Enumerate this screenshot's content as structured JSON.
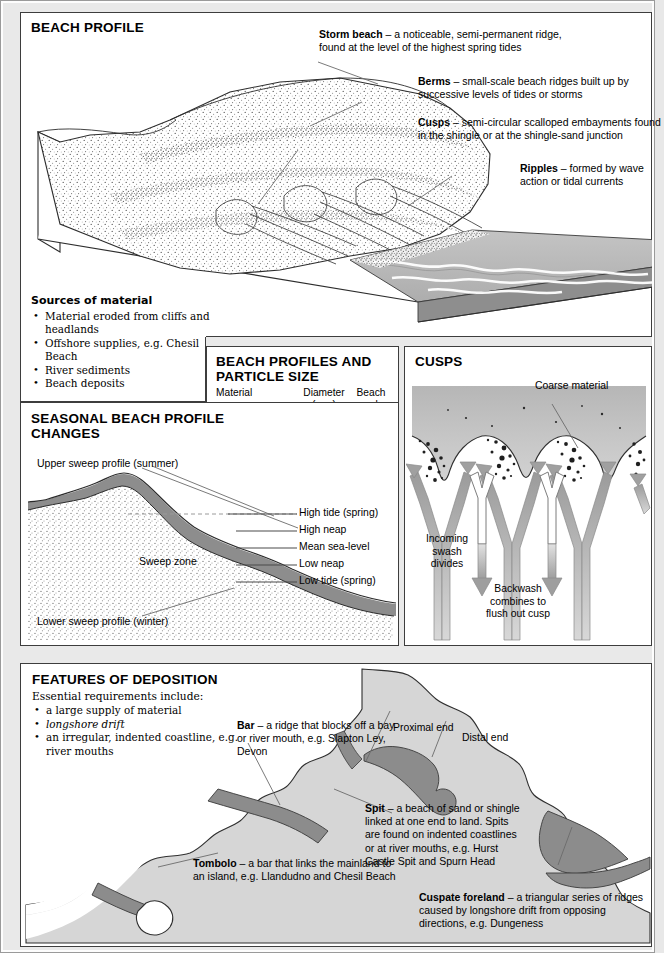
{
  "beach_profile": {
    "title": "BEACH PROFILE",
    "callouts": [
      {
        "term": "Storm beach",
        "text": " – a noticeable, semi-permanent ridge, found at the level of the highest spring tides"
      },
      {
        "term": "Berms",
        "text": " – small-scale beach ridges built up by successive levels of tides or storms"
      },
      {
        "term": "Cusps",
        "text": " – semi-circular scalloped embayments found in the shingle or at the shingle-sand junction"
      },
      {
        "term": "Ripples",
        "text": " – formed by wave action or tidal currents"
      }
    ],
    "sources": {
      "title": "Sources of material",
      "items": [
        "Material eroded from cliffs and headlands",
        "Offshore supplies, e.g. Chesil Beach",
        "River sediments",
        "Beach deposits"
      ]
    }
  },
  "particle_table": {
    "title": "BEACH PROFILES AND PARTICLE SIZE",
    "headers": {
      "material": "Material",
      "diameter": "Diameter",
      "diameter_unit": "(mm)",
      "angle": "Beach",
      "angle_unit": "angle"
    },
    "rows": [
      {
        "material": "Cobbles",
        "diameter": "32",
        "angle": "24°"
      },
      {
        "material": "Pcbblca",
        "diameter": "4",
        "angle": "17°"
      },
      {
        "material": "Coarse sand",
        "diameter": "2",
        "angle": "7°"
      },
      {
        "material": "Medium sand",
        "diameter": "0.2",
        "angle": "5°"
      },
      {
        "material": "Fine sand",
        "diameter": "0.02",
        "angle": "3°"
      },
      {
        "material": "Very fine sand",
        "diameter": "0.002",
        "angle": "1°"
      }
    ]
  },
  "cusps": {
    "title": "CUSPS",
    "coarse_material": "Coarse material",
    "incoming": "Incoming\nswash\ndivides",
    "incoming_lines": [
      "Incoming",
      "swash",
      "divides"
    ],
    "backwash_lines": [
      "Backwash",
      "combines to",
      "flush out cusp"
    ]
  },
  "seasonal": {
    "title": "SEASONAL BEACH PROFILE CHANGES",
    "upper_label": "Upper sweep profile (summer)",
    "lower_label": "Lower sweep profile (winter)",
    "sweep_zone": "Sweep zone",
    "tides": [
      "High tide (spring)",
      "High neap",
      "Mean sea-level",
      "Low neap",
      "Low tide (spring)"
    ]
  },
  "deposition": {
    "title": "FEATURES OF DEPOSITION",
    "subtitle": "Essential requirements include:",
    "requirements": [
      "a large supply of material",
      "longshore drift",
      "an irregular, indented coastline, e.g. river mouths"
    ],
    "labels": {
      "bar_term": "Bar",
      "bar_text": " – a ridge that blocks off a bay or river mouth, e.g. Slapton Ley, Devon",
      "proximal": "Proximal end",
      "distal": "Distal end",
      "spit_term": "Spit",
      "spit_text": " – a beach of sand or shingle linked at one end to land. Spits are found on indented coastlines or at river mouths, e.g. Hurst Castle Spit and Spurn Head",
      "tombolo_term": "Tombolo",
      "tombolo_text": " – a bar that links the mainland to an island, e.g. Llandudno and Chesil Beach",
      "cuspate_term": "Cuspate foreland",
      "cuspate_text": " – a triangular series of ridges caused by longshore drift from opposing directions, e.g. Dungeness"
    }
  },
  "colors": {
    "page_background": "#e9e9e9",
    "panel_background": "#ffffff",
    "border": "#3d3d3d",
    "leader_line": "#6b6b6b",
    "sea_grey": "#b8b8b8",
    "sea_dark": "#8f8f8f",
    "land_grey": "#d6d6d6",
    "feature_grey": "#8c8c8c",
    "sweep_zone": "#8d8d8d",
    "arrow_grey": "#a8a8a8"
  }
}
